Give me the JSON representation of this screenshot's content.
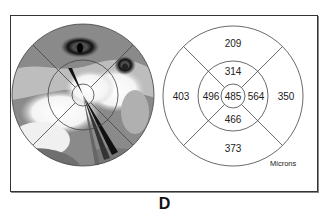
{
  "caption": "D",
  "thickness_map": {
    "units_label": "Microns",
    "center": "485",
    "inner": {
      "superior": "314",
      "nasal_left": "496",
      "temporal_right": "564",
      "inferior": "466"
    },
    "outer": {
      "superior": "209",
      "left": "403",
      "right": "350",
      "inferior": "373"
    }
  },
  "colors": {
    "line": "#444444",
    "map_gray": "#8a8a8a",
    "map_dark": "#1e1e1e",
    "map_light": "#f2f2f2"
  }
}
